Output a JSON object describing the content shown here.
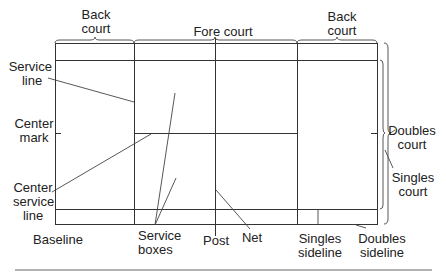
{
  "diagram": {
    "top_labels": {
      "back_court_left": [
        "Back",
        "court"
      ],
      "fore_court": "Fore court",
      "back_court_right": [
        "Back",
        "court"
      ]
    },
    "left_labels": {
      "service_line": [
        "Service",
        "line"
      ],
      "center_mark": [
        "Center",
        "mark"
      ],
      "center_service_line": [
        "Center",
        "service",
        "line"
      ]
    },
    "right_labels": {
      "doubles_court": [
        "Doubles",
        "court"
      ],
      "singles_court": [
        "Singles",
        "court"
      ]
    },
    "bottom_labels": {
      "baseline": "Baseline",
      "service_boxes": [
        "Service",
        "boxes"
      ],
      "post": "Post",
      "net": "Net",
      "singles_sideline": [
        "Singles",
        "sideline"
      ],
      "doubles_sideline": [
        "Doubles",
        "sideline"
      ]
    },
    "colors": {
      "line": "#333333",
      "leader": "#444444",
      "rule": "#999999"
    }
  }
}
